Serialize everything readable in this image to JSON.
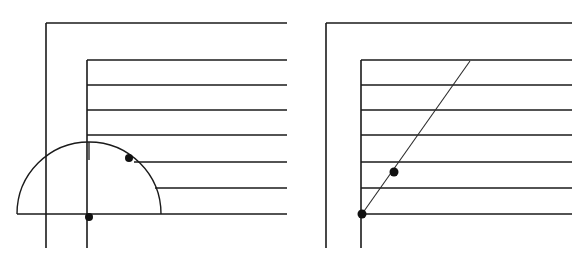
{
  "figure": {
    "canvas": {
      "width": 578,
      "height": 265,
      "background": "#ffffff"
    },
    "stroke_colors": {
      "rule": "#1a1a1a",
      "frame": "#1a1a1a",
      "diagonal": "#2b2b2b",
      "arc": "#1a1a1a",
      "dot": "#111111"
    },
    "stroke_widths": {
      "rule": 1.4,
      "frame": 1.6,
      "diagonal": 1.1,
      "arc": 1.4,
      "thin_tick": 1.3
    },
    "panels": [
      {
        "id": "left-panel",
        "name": "semicircle-protractor-panel",
        "label": "Left panel — semicircular protractor placed on baseline",
        "ruled_lines": [
          {
            "id": "rule-0",
            "y": 23,
            "x_start": 46,
            "x_end": 287
          },
          {
            "id": "rule-1",
            "y": 60,
            "x_start": 87,
            "x_end": 287
          },
          {
            "id": "rule-2",
            "y": 85,
            "x_start": 87,
            "x_end": 287
          },
          {
            "id": "rule-3",
            "y": 110,
            "x_start": 87,
            "x_end": 287
          },
          {
            "id": "rule-4",
            "y": 135,
            "x_start": 87,
            "x_end": 287
          },
          {
            "id": "rule-5",
            "y": 162,
            "x_start": 134,
            "x_end": 287
          },
          {
            "id": "rule-6",
            "y": 188,
            "x_start": 155,
            "x_end": 287
          },
          {
            "id": "rule-7",
            "y": 214,
            "x_start": 17,
            "x_end": 287
          }
        ],
        "vertical_lines": [
          {
            "id": "outer-vertical",
            "x": 46,
            "y_start": 23,
            "y_end": 248
          },
          {
            "id": "inner-vertical",
            "x": 87,
            "y_start": 60,
            "y_end": 248
          }
        ],
        "semicircle": {
          "center_x": 89,
          "center_y": 214,
          "radius": 72,
          "start_angle_deg": 180,
          "end_angle_deg": 0
        },
        "center_tick": {
          "x": 89,
          "y_start": 142,
          "y_end": 160
        },
        "dots": [
          {
            "id": "dot-origin",
            "x": 89,
            "y": 217,
            "r": 4.0,
            "label": "vertex / protractor centre"
          },
          {
            "id": "dot-angle",
            "x": 129,
            "y": 158,
            "r": 4.0,
            "label": "angle mark on arc"
          }
        ]
      },
      {
        "id": "right-panel",
        "name": "angle-ray-panel",
        "label": "Right panel — straight ray drawn through the marked points",
        "ruled_lines": [
          {
            "id": "rule-0",
            "y": 23,
            "x_start": 326,
            "x_end": 572
          },
          {
            "id": "rule-1",
            "y": 60,
            "x_start": 361,
            "x_end": 572
          },
          {
            "id": "rule-2",
            "y": 85,
            "x_start": 361,
            "x_end": 572
          },
          {
            "id": "rule-3",
            "y": 110,
            "x_start": 361,
            "x_end": 572
          },
          {
            "id": "rule-4",
            "y": 135,
            "x_start": 361,
            "x_end": 572
          },
          {
            "id": "rule-5",
            "y": 162,
            "x_start": 361,
            "x_end": 572
          },
          {
            "id": "rule-6",
            "y": 188,
            "x_start": 361,
            "x_end": 572
          },
          {
            "id": "rule-7",
            "y": 214,
            "x_start": 361,
            "x_end": 572
          }
        ],
        "vertical_lines": [
          {
            "id": "outer-vertical",
            "x": 326,
            "y_start": 23,
            "y_end": 248
          },
          {
            "id": "inner-vertical",
            "x": 361,
            "y_start": 60,
            "y_end": 248
          }
        ],
        "ray": {
          "x1": 362,
          "y1": 214,
          "x2": 470,
          "y2": 61
        },
        "dots": [
          {
            "id": "dot-origin",
            "x": 362,
            "y": 214,
            "r": 4.5,
            "label": "ray origin at baseline"
          },
          {
            "id": "dot-mid",
            "x": 394,
            "y": 172,
            "r": 4.5,
            "label": "point the ray passes through"
          }
        ]
      }
    ]
  }
}
